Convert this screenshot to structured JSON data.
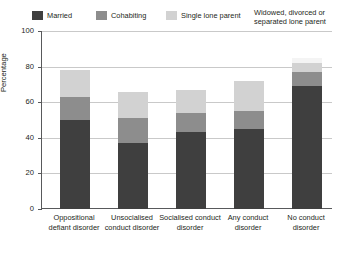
{
  "chart_data": {
    "type": "bar",
    "subtype": "stacked-bar",
    "title": "",
    "xlabel": "",
    "ylabel": "Percentage",
    "ylim": [
      0,
      100
    ],
    "yticks": [
      0,
      20,
      40,
      60,
      80,
      100
    ],
    "grid": true,
    "legend_position": "top",
    "categories": [
      "Oppositional defiant disorder",
      "Unsocialised conduct disorder",
      "Socialised conduct disorder",
      "Any conduct disorder",
      "No conduct disorder"
    ],
    "series": [
      {
        "name": "Married",
        "color": "#3f3f3f",
        "values": [
          50,
          37,
          43,
          45,
          69
        ]
      },
      {
        "name": "Cohabiting",
        "color": "#8d8d8d",
        "values": [
          13,
          14,
          11,
          10,
          8
        ]
      },
      {
        "name": "Single lone parent",
        "color": "#d2d2d2",
        "values": [
          15,
          15,
          13,
          17,
          5
        ]
      },
      {
        "name": "Widowed, divorced or separated lone parent",
        "color": "#f4f4f4",
        "values": [
          0,
          0,
          0,
          0,
          3
        ]
      }
    ],
    "stack_totals": [
      78,
      66,
      67,
      72,
      85
    ]
  },
  "legend": {
    "items": [
      {
        "label": "Married",
        "color": "#3f3f3f"
      },
      {
        "label": "Cohabiting",
        "color": "#8d8d8d"
      },
      {
        "label": "Single lone parent",
        "color": "#d2d2d2"
      },
      {
        "label": "Widowed, divorced or separated lone parent",
        "color": "#fdfdfd"
      }
    ]
  },
  "axis": {
    "y_title": "Percentage",
    "y_ticks": [
      "100",
      "80",
      "60",
      "40",
      "20",
      "0"
    ]
  },
  "x_labels": [
    "Oppositional defiant disorder",
    "Unsocialised conduct disorder",
    "Socialised conduct disorder",
    "Any conduct disorder",
    "No conduct disorder"
  ]
}
